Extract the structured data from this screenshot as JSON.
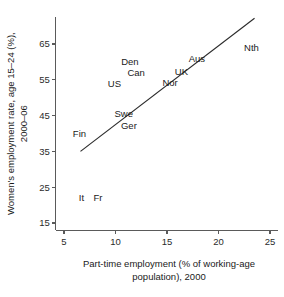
{
  "chart_data": {
    "type": "scatter",
    "title": "",
    "subtitle": "",
    "xlabel_line1": "Part-time employment (% of working-age",
    "xlabel_line2": "population), 2000",
    "ylabel_line1": "Women's employment rate, age 15–24 (%),",
    "ylabel_line2": "2000–06",
    "xlim": [
      4.2,
      25.8
    ],
    "ylim": [
      13.0,
      72.5
    ],
    "xticks": [
      5,
      10,
      15,
      20,
      25
    ],
    "xtick_labels": [
      "5",
      "10",
      "15",
      "20",
      "25"
    ],
    "yticks": [
      15,
      25,
      35,
      45,
      55,
      65
    ],
    "ytick_labels": [
      "15",
      "25",
      "35",
      "45",
      "55",
      "65"
    ],
    "grid": false,
    "legend": "none",
    "marker_style": "text-label-only",
    "points": [
      {
        "label": "Fin",
        "x": 6.5,
        "y": 40.0
      },
      {
        "label": "It",
        "x": 6.7,
        "y": 22.0
      },
      {
        "label": "Fr",
        "x": 8.3,
        "y": 22.2
      },
      {
        "label": "US",
        "x": 9.9,
        "y": 54.0
      },
      {
        "label": "Swe",
        "x": 10.8,
        "y": 45.6
      },
      {
        "label": "Ger",
        "x": 11.3,
        "y": 42.2
      },
      {
        "label": "Den",
        "x": 11.4,
        "y": 60.2
      },
      {
        "label": "Can",
        "x": 12.0,
        "y": 57.0
      },
      {
        "label": "Nor",
        "x": 15.3,
        "y": 54.3
      },
      {
        "label": "UK",
        "x": 16.4,
        "y": 57.2
      },
      {
        "label": "Aus",
        "x": 17.9,
        "y": 61.0
      },
      {
        "label": "Nth",
        "x": 23.2,
        "y": 64.0
      }
    ],
    "trend_line": {
      "name": "fitted regression line",
      "x_start": 6.6,
      "y_start": 35.0,
      "x_end": 23.5,
      "y_end": 72.2
    },
    "colors": {
      "axis": "#5a5a5a",
      "text": "#1a1a1a",
      "trend_line": "#2b2b2b",
      "background": "#ffffff"
    }
  }
}
